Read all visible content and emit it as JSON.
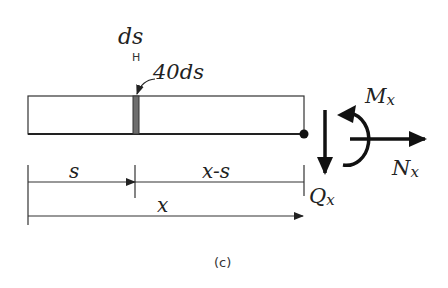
{
  "figure": {
    "caption": "(c)",
    "labels": {
      "ds_top": "ds",
      "ds_marker": "H",
      "element": "40ds",
      "s": "s",
      "x_minus_s": "x-s",
      "x": "x",
      "moment": {
        "main": "M",
        "sub": "x"
      },
      "normal": {
        "main": "N",
        "sub": "x"
      },
      "shear": {
        "main": "Q",
        "sub": "x"
      }
    },
    "colors": {
      "line": "#222222",
      "element_fill": "#6e6e6e",
      "background": "#ffffff"
    }
  }
}
